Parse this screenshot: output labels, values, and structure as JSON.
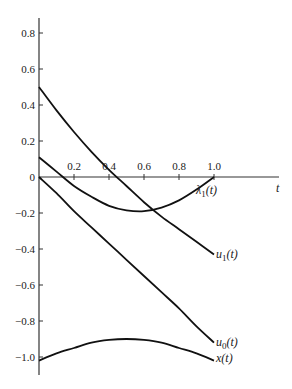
{
  "chart_data": {
    "type": "line",
    "title": "",
    "xlabel": "t",
    "ylabel": "",
    "xlim": [
      0,
      1.0
    ],
    "ylim": [
      -1.1,
      0.85
    ],
    "grid": false,
    "x_ticks": [
      "0.2",
      "0.4",
      "0.6",
      "0.8",
      "1.0"
    ],
    "y_ticks": [
      "0.8",
      "0.6",
      "0.4",
      "0.2",
      "0",
      "-0.2",
      "-0.4",
      "-0.6",
      "-0.8",
      "-1.0"
    ],
    "x": [
      0,
      0.1,
      0.2,
      0.3,
      0.4,
      0.5,
      0.6,
      0.7,
      0.8,
      0.9,
      1.0
    ],
    "series": [
      {
        "name": "u1(t)",
        "label": "u",
        "sub": "1",
        "values": [
          0.5,
          0.37,
          0.25,
          0.14,
          0.04,
          -0.05,
          -0.14,
          -0.22,
          -0.29,
          -0.36,
          -0.43
        ]
      },
      {
        "name": "λ1(t)",
        "label": "λ",
        "sub": "1",
        "values": [
          0.11,
          0.03,
          -0.05,
          -0.11,
          -0.16,
          -0.185,
          -0.19,
          -0.17,
          -0.13,
          -0.07,
          0.0
        ]
      },
      {
        "name": "u0(t)",
        "label": "u",
        "sub": "0",
        "values": [
          0.0,
          -0.09,
          -0.19,
          -0.28,
          -0.37,
          -0.46,
          -0.55,
          -0.64,
          -0.73,
          -0.83,
          -0.92
        ]
      },
      {
        "name": "x(t)",
        "label": "x",
        "sub": "",
        "values": [
          -1.02,
          -0.98,
          -0.95,
          -0.92,
          -0.905,
          -0.9,
          -0.905,
          -0.92,
          -0.95,
          -0.98,
          -1.02
        ]
      }
    ]
  },
  "axis": {
    "t_label": "t",
    "zero_label": "0"
  }
}
